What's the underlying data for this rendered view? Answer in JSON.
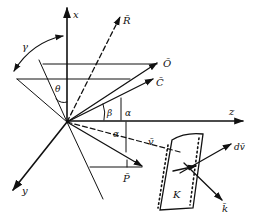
{
  "figure": {
    "axes": {
      "x": "x",
      "y": "y",
      "z": "z"
    },
    "vectors": {
      "R": "R̄",
      "O": "Ō",
      "C": "C̄",
      "v": "v̄",
      "P": "P̄",
      "k": "k̄",
      "dv": "dv̄"
    },
    "angles": {
      "gamma": "γ",
      "theta": "θ",
      "beta": "β",
      "alpha_upper": "α",
      "alpha_lower": "α"
    },
    "element": {
      "label": "K"
    },
    "colors": {
      "ink": "#111111",
      "background": "#ffffff"
    }
  }
}
